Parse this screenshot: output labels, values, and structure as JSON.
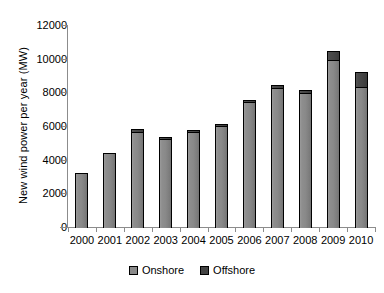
{
  "chart_data": {
    "type": "bar",
    "subtype": "stacked-column",
    "title": "",
    "subtitle": "",
    "xlabel": "",
    "ylabel": "New wind power per year (MW)",
    "categories": [
      "2000",
      "2001",
      "2002",
      "2003",
      "2004",
      "2005",
      "2006",
      "2007",
      "2008",
      "2009",
      "2010"
    ],
    "series": [
      {
        "name": "Onshore",
        "color": "#8a8a8a",
        "values": [
          3270,
          4430,
          5690,
          5300,
          5730,
          6090,
          7480,
          8310,
          8000,
          9970,
          8400
        ]
      },
      {
        "name": "Offshore",
        "color": "#434343",
        "values": [
          0,
          0,
          250,
          150,
          100,
          110,
          90,
          240,
          250,
          580,
          900
        ]
      }
    ],
    "totals": [
      3270,
      4430,
      5940,
      5450,
      5830,
      6200,
      7570,
      8550,
      8250,
      10550,
      9300
    ],
    "ylim": [
      0,
      12000
    ],
    "yticks": [
      0,
      2000,
      4000,
      6000,
      8000,
      10000,
      12000
    ],
    "ytick_labels": [
      "0",
      "2000",
      "4000",
      "6000",
      "8000",
      "10000",
      "12000"
    ],
    "grid": false,
    "legend_position": "bottom",
    "legend": [
      "Onshore",
      "Offshore"
    ]
  },
  "axis": {
    "y_title": "New wind power per year (MW)"
  },
  "legend": {
    "items": [
      {
        "label": "Onshore",
        "swatch": "onshore-swatch"
      },
      {
        "label": "Offshore",
        "swatch": "offshore-swatch"
      }
    ]
  }
}
